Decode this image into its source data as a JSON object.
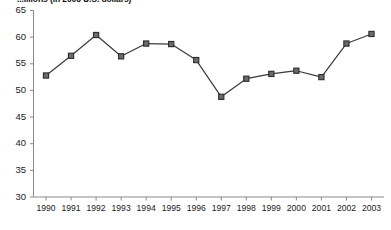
{
  "chart_data": {
    "type": "line",
    "title": "...illions (in 2003 U.S. dollars)",
    "xlabel": "",
    "ylabel": "",
    "categories": [
      "1990",
      "1991",
      "1992",
      "1993",
      "1994",
      "1995",
      "1996",
      "1997",
      "1998",
      "1999",
      "2000",
      "2001",
      "2002",
      "2003"
    ],
    "values": [
      52.8,
      56.5,
      60.4,
      56.4,
      58.8,
      58.7,
      55.7,
      48.8,
      52.2,
      53.1,
      53.7,
      52.5,
      58.8,
      60.6
    ],
    "ylim": [
      30,
      65
    ],
    "yticks": [
      30,
      35,
      40,
      45,
      50,
      55,
      60,
      65
    ],
    "ytick_labels": [
      "30",
      "35",
      "40",
      "45",
      "50",
      "55",
      "60",
      "65"
    ],
    "grid": false,
    "legend": false,
    "series": [
      {
        "name": "series-1",
        "values": [
          52.8,
          56.5,
          60.4,
          56.4,
          58.8,
          58.7,
          55.7,
          48.8,
          52.2,
          53.1,
          53.7,
          52.5,
          58.8,
          60.6
        ]
      }
    ],
    "marker": "square",
    "line_color": "#3a3a3a",
    "marker_fill": "#6b6b6b",
    "marker_edge": "#2b2b2b",
    "axis_color": "#8a8a8a"
  }
}
